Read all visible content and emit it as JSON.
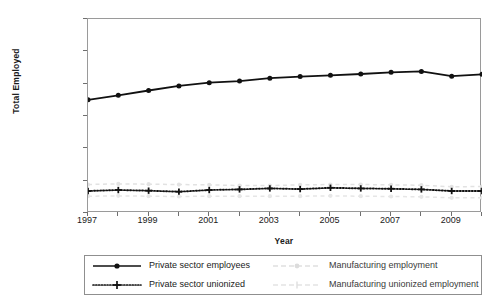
{
  "chart_data": {
    "type": "line",
    "title": "",
    "xlabel": "Year",
    "ylabel": "Total Employed",
    "xlim": [
      1997,
      2010
    ],
    "ylim": [
      0,
      6000000
    ],
    "grid": false,
    "legend_position": "bottom",
    "x": [
      1997,
      1998,
      1999,
      2000,
      2001,
      2002,
      2003,
      2004,
      2005,
      2006,
      2007,
      2008,
      2009,
      2010
    ],
    "x_tick_labels": [
      "1997",
      "1999",
      "2001",
      "2003",
      "2005",
      "2007",
      "2009"
    ],
    "x_ticks": [
      1997,
      1999,
      2001,
      2003,
      2005,
      2007,
      2009
    ],
    "y_tick_labels": [
      "0",
      "1,000,000",
      "2,000,000",
      "3,000,000",
      "4,000,000",
      "5,000,000",
      "6,000,000"
    ],
    "y_ticks": [
      0,
      1000000,
      2000000,
      3000000,
      4000000,
      5000000,
      6000000
    ],
    "series": [
      {
        "name": "Private sector employees",
        "style": "solid-marker",
        "color": "#111111",
        "values": [
          3500000,
          3640000,
          3790000,
          3930000,
          4030000,
          4080000,
          4170000,
          4220000,
          4260000,
          4300000,
          4350000,
          4380000,
          4230000,
          4290000
        ]
      },
      {
        "name": "Private sector unionized",
        "style": "dotted-marker",
        "color": "#111111",
        "values": [
          680000,
          710000,
          690000,
          660000,
          710000,
          730000,
          760000,
          740000,
          780000,
          760000,
          750000,
          730000,
          680000,
          680000
        ]
      },
      {
        "name": "Manufacturing employment",
        "style": "faint-dashed",
        "color": "#e2e2e2",
        "values": [
          880000,
          900000,
          890000,
          880000,
          870000,
          850000,
          850000,
          870000,
          880000,
          880000,
          870000,
          860000,
          810000,
          820000
        ]
      },
      {
        "name": "Manufacturing unionized employment",
        "style": "faint-dashed",
        "color": "#e6e6e6",
        "values": [
          520000,
          530000,
          520000,
          510000,
          520000,
          520000,
          520000,
          520000,
          530000,
          520000,
          510000,
          500000,
          470000,
          470000
        ]
      }
    ]
  },
  "axes": {
    "y_title": "Total Employed",
    "x_title": "Year"
  },
  "legend": {
    "items": [
      {
        "label": "Private sector employees",
        "swatch": "solid-line-dot-marker-icon"
      },
      {
        "label": "Manufacturing employment",
        "swatch": "faint-dashed-line-icon"
      },
      {
        "label": "Private sector unionized",
        "swatch": "dotted-line-plus-marker-icon"
      },
      {
        "label": "Manufacturing unionized employment",
        "swatch": "faint-dashed-line-icon"
      }
    ]
  }
}
